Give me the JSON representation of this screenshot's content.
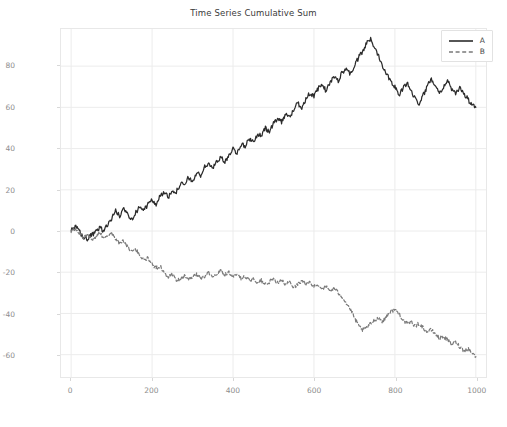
{
  "chart_data": {
    "type": "line",
    "title": "Time Series Cumulative Sum",
    "xlabel": "",
    "ylabel": "",
    "xlim": [
      -25,
      1025
    ],
    "ylim": [
      -71,
      98
    ],
    "xticks": [
      0,
      200,
      400,
      600,
      800,
      1000
    ],
    "yticks": [
      -60,
      -40,
      -20,
      0,
      20,
      40,
      60,
      80
    ],
    "grid": true,
    "legend_position": "upper right",
    "background": "#ffffff",
    "series": [
      {
        "name": "A",
        "color": "#2b2b2b",
        "linestyle": "solid",
        "x": [
          0,
          10,
          20,
          30,
          40,
          50,
          60,
          70,
          80,
          90,
          100,
          110,
          120,
          130,
          140,
          150,
          160,
          170,
          180,
          190,
          200,
          210,
          220,
          230,
          240,
          250,
          260,
          270,
          280,
          290,
          300,
          310,
          320,
          330,
          340,
          350,
          360,
          370,
          380,
          390,
          400,
          410,
          420,
          430,
          440,
          450,
          460,
          470,
          480,
          490,
          500,
          510,
          520,
          530,
          540,
          550,
          560,
          570,
          580,
          590,
          600,
          610,
          620,
          630,
          640,
          650,
          660,
          670,
          680,
          690,
          700,
          710,
          720,
          730,
          740,
          750,
          760,
          770,
          780,
          790,
          800,
          810,
          820,
          830,
          840,
          850,
          860,
          870,
          880,
          890,
          900,
          910,
          920,
          930,
          940,
          950,
          960,
          970,
          980,
          990,
          1000
        ],
        "values": [
          0,
          2,
          0,
          -3,
          -4,
          -2,
          -1,
          2,
          0,
          3,
          6,
          10,
          7,
          11,
          8,
          6,
          9,
          12,
          10,
          13,
          15,
          13,
          17,
          19,
          16,
          20,
          19,
          23,
          22,
          26,
          24,
          28,
          27,
          31,
          33,
          30,
          34,
          36,
          33,
          37,
          40,
          38,
          42,
          41,
          45,
          43,
          47,
          46,
          50,
          48,
          52,
          55,
          53,
          57,
          55,
          59,
          62,
          60,
          64,
          67,
          65,
          69,
          71,
          68,
          72,
          75,
          73,
          77,
          79,
          76,
          80,
          84,
          87,
          91,
          93,
          89,
          85,
          80,
          76,
          73,
          70,
          66,
          69,
          72,
          68,
          64,
          62,
          66,
          70,
          74,
          71,
          67,
          70,
          73,
          69,
          66,
          70,
          67,
          64,
          61,
          60
        ]
      },
      {
        "name": "B",
        "color": "#7a7a7a",
        "linestyle": "dashed",
        "x": [
          0,
          10,
          20,
          30,
          40,
          50,
          60,
          70,
          80,
          90,
          100,
          110,
          120,
          130,
          140,
          150,
          160,
          170,
          180,
          190,
          200,
          210,
          220,
          230,
          240,
          250,
          260,
          270,
          280,
          290,
          300,
          310,
          320,
          330,
          340,
          350,
          360,
          370,
          380,
          390,
          400,
          410,
          420,
          430,
          440,
          450,
          460,
          470,
          480,
          490,
          500,
          510,
          520,
          530,
          540,
          550,
          560,
          570,
          580,
          590,
          600,
          610,
          620,
          630,
          640,
          650,
          660,
          670,
          680,
          690,
          700,
          710,
          720,
          730,
          740,
          750,
          760,
          770,
          780,
          790,
          800,
          810,
          820,
          830,
          840,
          850,
          860,
          870,
          880,
          890,
          900,
          910,
          920,
          930,
          940,
          950,
          960,
          970,
          980,
          990,
          1000
        ],
        "values": [
          0,
          1,
          -1,
          -3,
          -2,
          -4,
          -3,
          -1,
          -3,
          -2,
          -1,
          -4,
          -6,
          -5,
          -8,
          -10,
          -9,
          -12,
          -14,
          -13,
          -16,
          -18,
          -17,
          -20,
          -22,
          -21,
          -24,
          -23,
          -22,
          -24,
          -22,
          -21,
          -23,
          -22,
          -20,
          -22,
          -21,
          -19,
          -21,
          -20,
          -22,
          -21,
          -23,
          -22,
          -24,
          -23,
          -25,
          -24,
          -26,
          -25,
          -23,
          -25,
          -24,
          -26,
          -25,
          -27,
          -26,
          -24,
          -26,
          -25,
          -27,
          -26,
          -28,
          -27,
          -29,
          -28,
          -30,
          -32,
          -35,
          -38,
          -42,
          -46,
          -48,
          -47,
          -45,
          -43,
          -42,
          -44,
          -41,
          -39,
          -38,
          -40,
          -43,
          -45,
          -44,
          -46,
          -45,
          -47,
          -49,
          -48,
          -50,
          -52,
          -51,
          -53,
          -55,
          -54,
          -56,
          -58,
          -57,
          -59,
          -61
        ]
      }
    ]
  },
  "legend": {
    "entries": [
      {
        "label": "A"
      },
      {
        "label": "B"
      }
    ]
  },
  "axes": {
    "xticklabels": [
      "0",
      "200",
      "400",
      "600",
      "800",
      "1000"
    ],
    "yticklabels": [
      "-60",
      "-40",
      "-20",
      "0",
      "20",
      "40",
      "60",
      "80"
    ]
  }
}
